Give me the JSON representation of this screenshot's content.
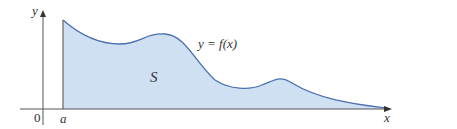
{
  "figure": {
    "axis_labels": {
      "y": "y",
      "x": "x",
      "origin": "0",
      "a": "a"
    },
    "curve_label": "y = f(x)",
    "region_label": "S",
    "colors": {
      "fill": "#cfe0f3",
      "curve": "#4a6fb0",
      "axis": "#555555"
    }
  }
}
